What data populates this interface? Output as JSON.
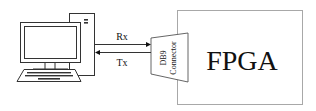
{
  "diagram": {
    "computer": {
      "label": ""
    },
    "links": {
      "rx": {
        "label": "Rx",
        "direction": "computer-to-fpga"
      },
      "tx": {
        "label": "Tx",
        "direction": "fpga-to-computer"
      }
    },
    "connector": {
      "line1": "DB9",
      "line2": "Connector"
    },
    "fpga": {
      "label": "FPGA"
    }
  },
  "colors": {
    "stroke": "#333333",
    "box_stroke": "#a8a8a8",
    "text": "#111111"
  }
}
